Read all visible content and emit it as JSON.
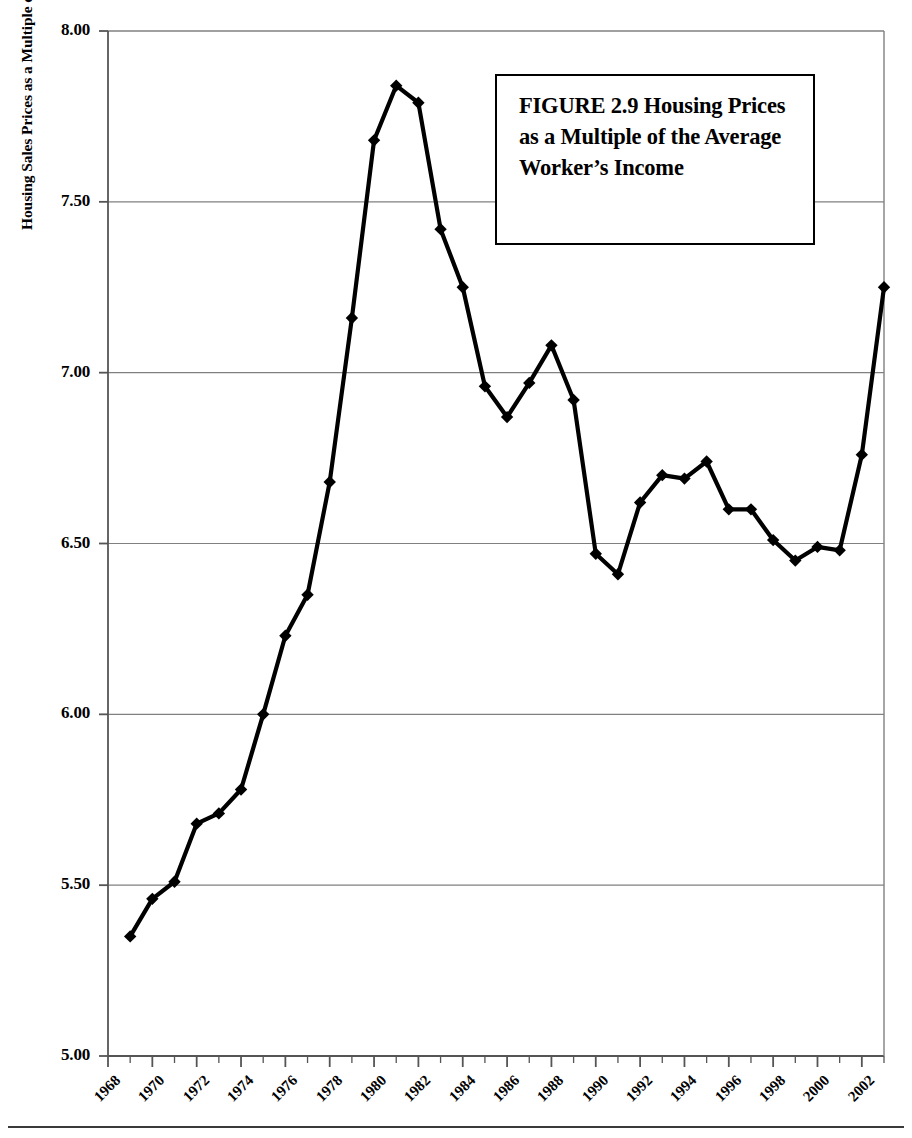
{
  "figure": {
    "title": "FIGURE 2.9  Housing Prices as a Multiple of the Average Worker’s Income",
    "title_label": "figure-title"
  },
  "axes": {
    "y_axis_title": "Housing Sales Prices as a Multiple of Median Income per Worker",
    "y_tick_labels": [
      "8.00",
      "7.50",
      "7.00",
      "6.50",
      "6.00",
      "5.50",
      "5.00"
    ],
    "x_tick_labels": [
      "1968",
      "1970",
      "1972",
      "1974",
      "1976",
      "1978",
      "1980",
      "1982",
      "1984",
      "1986",
      "1988",
      "1990",
      "1992",
      "1994",
      "1996",
      "1998",
      "2000",
      "2002"
    ]
  },
  "colors": {
    "line": "#000000",
    "marker": "#000000",
    "gridline": "#808080",
    "axis": "#555555",
    "background": "#ffffff"
  },
  "chart_data": {
    "type": "line",
    "title": "FIGURE 2.9  Housing Prices as a Multiple of the Average Worker’s Income",
    "xlabel": "",
    "ylabel": "Housing Sales Prices as a Multiple of Median Income per Worker",
    "xlim": [
      1968,
      2003
    ],
    "ylim": [
      5.0,
      8.0
    ],
    "ytick_values": [
      5.0,
      5.5,
      6.0,
      6.5,
      7.0,
      7.5,
      8.0
    ],
    "xtick_values": [
      1968,
      1970,
      1972,
      1974,
      1976,
      1978,
      1980,
      1982,
      1984,
      1986,
      1988,
      1990,
      1992,
      1994,
      1996,
      1998,
      2000,
      2002
    ],
    "grid": "horizontal",
    "legend": "none",
    "marker": "diamond",
    "series": [
      {
        "name": "Housing price to income multiple",
        "x": [
          1969,
          1970,
          1971,
          1972,
          1973,
          1974,
          1975,
          1976,
          1977,
          1978,
          1979,
          1980,
          1981,
          1982,
          1983,
          1984,
          1985,
          1986,
          1987,
          1988,
          1989,
          1990,
          1991,
          1992,
          1993,
          1994,
          1995,
          1996,
          1997,
          1998,
          1999,
          2000,
          2001,
          2002,
          2003
        ],
        "y": [
          5.35,
          5.46,
          5.51,
          5.68,
          5.71,
          5.78,
          6.0,
          6.23,
          6.35,
          6.68,
          7.16,
          7.68,
          7.84,
          7.79,
          7.42,
          7.25,
          6.96,
          6.87,
          6.97,
          7.08,
          6.92,
          6.47,
          6.41,
          6.62,
          6.7,
          6.69,
          6.74,
          6.6,
          6.6,
          6.51,
          6.45,
          6.49,
          6.48,
          6.76,
          7.25
        ]
      }
    ]
  }
}
